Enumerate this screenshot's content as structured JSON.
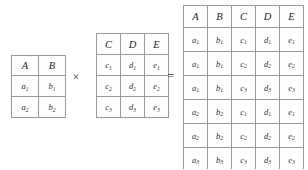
{
  "diagram": {
    "kind": "cartesian-product",
    "operators": {
      "times": "×",
      "equals": "="
    },
    "left_table": {
      "name": "relation-ab",
      "headers": [
        "A",
        "B"
      ],
      "rows": [
        [
          {
            "base": "a",
            "sub": "1"
          },
          {
            "base": "b",
            "sub": "1"
          }
        ],
        [
          {
            "base": "a",
            "sub": "2"
          },
          {
            "base": "b",
            "sub": "2"
          }
        ]
      ]
    },
    "right_table": {
      "name": "relation-cde",
      "headers": [
        "C",
        "D",
        "E"
      ],
      "rows": [
        [
          {
            "base": "c",
            "sub": "1"
          },
          {
            "base": "d",
            "sub": "1"
          },
          {
            "base": "e",
            "sub": "1"
          }
        ],
        [
          {
            "base": "c",
            "sub": "2"
          },
          {
            "base": "d",
            "sub": "2"
          },
          {
            "base": "e",
            "sub": "2"
          }
        ],
        [
          {
            "base": "c",
            "sub": "3"
          },
          {
            "base": "d",
            "sub": "3"
          },
          {
            "base": "e",
            "sub": "3"
          }
        ]
      ]
    },
    "result_table": {
      "name": "relation-product",
      "headers": [
        "A",
        "B",
        "C",
        "D",
        "E"
      ],
      "rows": [
        [
          {
            "base": "a",
            "sub": "1"
          },
          {
            "base": "b",
            "sub": "1"
          },
          {
            "base": "c",
            "sub": "1"
          },
          {
            "base": "d",
            "sub": "1"
          },
          {
            "base": "e",
            "sub": "1"
          }
        ],
        [
          {
            "base": "a",
            "sub": "1"
          },
          {
            "base": "b",
            "sub": "1"
          },
          {
            "base": "c",
            "sub": "2"
          },
          {
            "base": "d",
            "sub": "2"
          },
          {
            "base": "e",
            "sub": "2"
          }
        ],
        [
          {
            "base": "a",
            "sub": "1"
          },
          {
            "base": "b",
            "sub": "1"
          },
          {
            "base": "c",
            "sub": "3"
          },
          {
            "base": "d",
            "sub": "3"
          },
          {
            "base": "e",
            "sub": "3"
          }
        ],
        [
          {
            "base": "a",
            "sub": "2"
          },
          {
            "base": "b",
            "sub": "2"
          },
          {
            "base": "c",
            "sub": "1"
          },
          {
            "base": "d",
            "sub": "1"
          },
          {
            "base": "e",
            "sub": "1"
          }
        ],
        [
          {
            "base": "a",
            "sub": "2"
          },
          {
            "base": "b",
            "sub": "2"
          },
          {
            "base": "c",
            "sub": "2"
          },
          {
            "base": "d",
            "sub": "2"
          },
          {
            "base": "e",
            "sub": "2"
          }
        ],
        [
          {
            "base": "a",
            "sub": "3"
          },
          {
            "base": "b",
            "sub": "3"
          },
          {
            "base": "c",
            "sub": "3"
          },
          {
            "base": "d",
            "sub": "3"
          },
          {
            "base": "e",
            "sub": "3"
          }
        ]
      ]
    },
    "colors": {
      "background": "#ffffff",
      "cell_background": "#fdfdfd",
      "border": "#9a9a9a",
      "header_text": "#1f1f1f",
      "cell_text": "#2f2f2f"
    }
  }
}
